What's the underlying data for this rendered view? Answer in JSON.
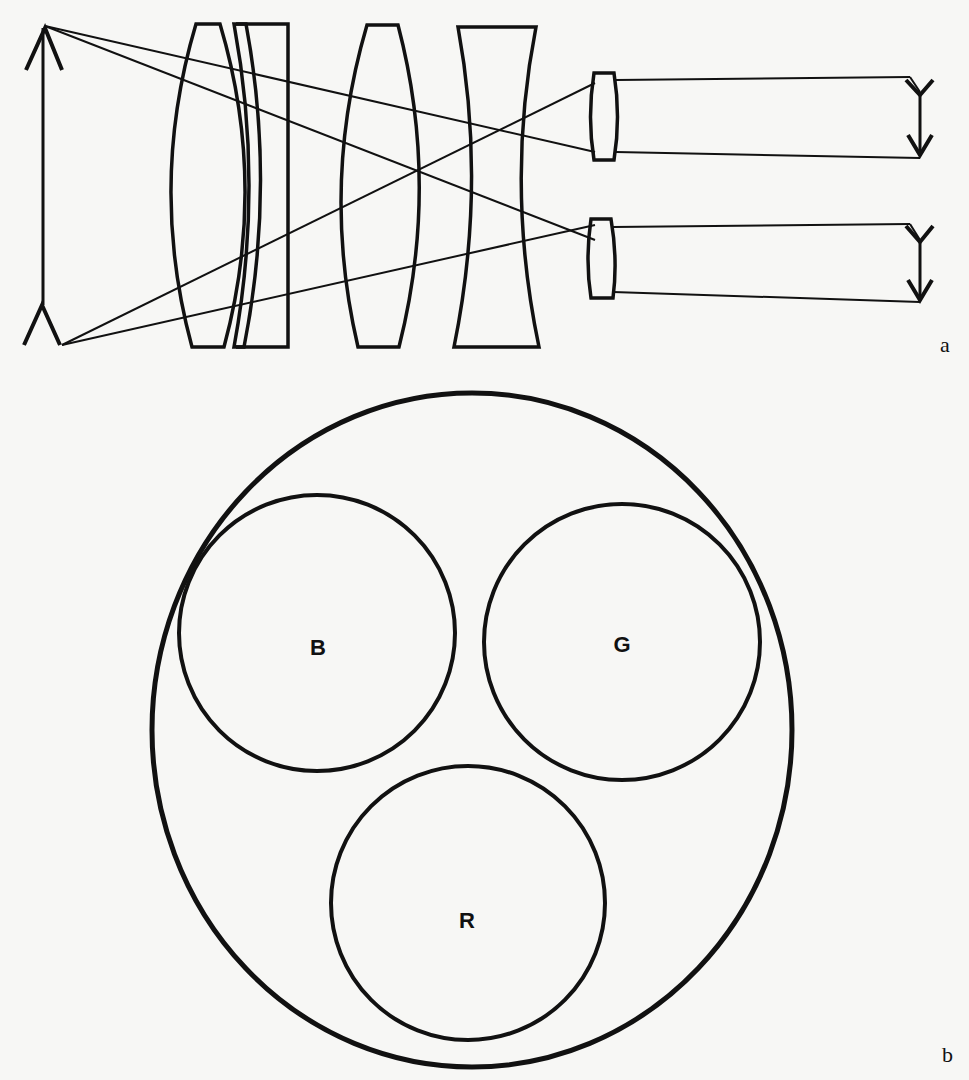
{
  "figure": {
    "panel_a": {
      "label": "a",
      "description": "Optical lens train: object arrow on left, multi-element objective, two small relay lenses forming two inverted images on right",
      "elements": [
        "object-arrow",
        "biconvex-lens-1",
        "meniscus-lens",
        "plano-concave-plate",
        "biconvex-lens-2",
        "biconcave-lens",
        "relay-lens-top",
        "relay-lens-bottom",
        "image-arrow-top",
        "image-arrow-bottom"
      ]
    },
    "panel_b": {
      "label": "b",
      "description": "Large circle containing three smaller circles labeled B, G and R",
      "circles": [
        {
          "id": "blue",
          "label": "B"
        },
        {
          "id": "green",
          "label": "G"
        },
        {
          "id": "red",
          "label": "R"
        }
      ]
    }
  },
  "colors": {
    "ink": "#111111",
    "paper": "#f7f7f5"
  }
}
